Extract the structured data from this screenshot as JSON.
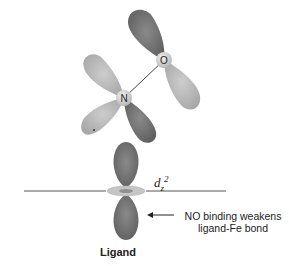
{
  "diagram": {
    "atoms": [
      {
        "symbol": "O",
        "x": 164,
        "y": 60
      },
      {
        "symbol": "N",
        "x": 124,
        "y": 98
      }
    ],
    "orbital": {
      "name": "d",
      "subscript": "z",
      "superscript": "2"
    },
    "annotation": {
      "line1": "NO binding weakens",
      "line2": "ligand-Fe bond",
      "arrow": "left-arrow"
    },
    "caption": "Ligand",
    "colors": {
      "dark_lobe": "#6e6e6e",
      "light_lobe": "#b4b4b4",
      "ring": "#c8c8c8",
      "atom": "#d0d0d0",
      "line": "#444444"
    }
  }
}
